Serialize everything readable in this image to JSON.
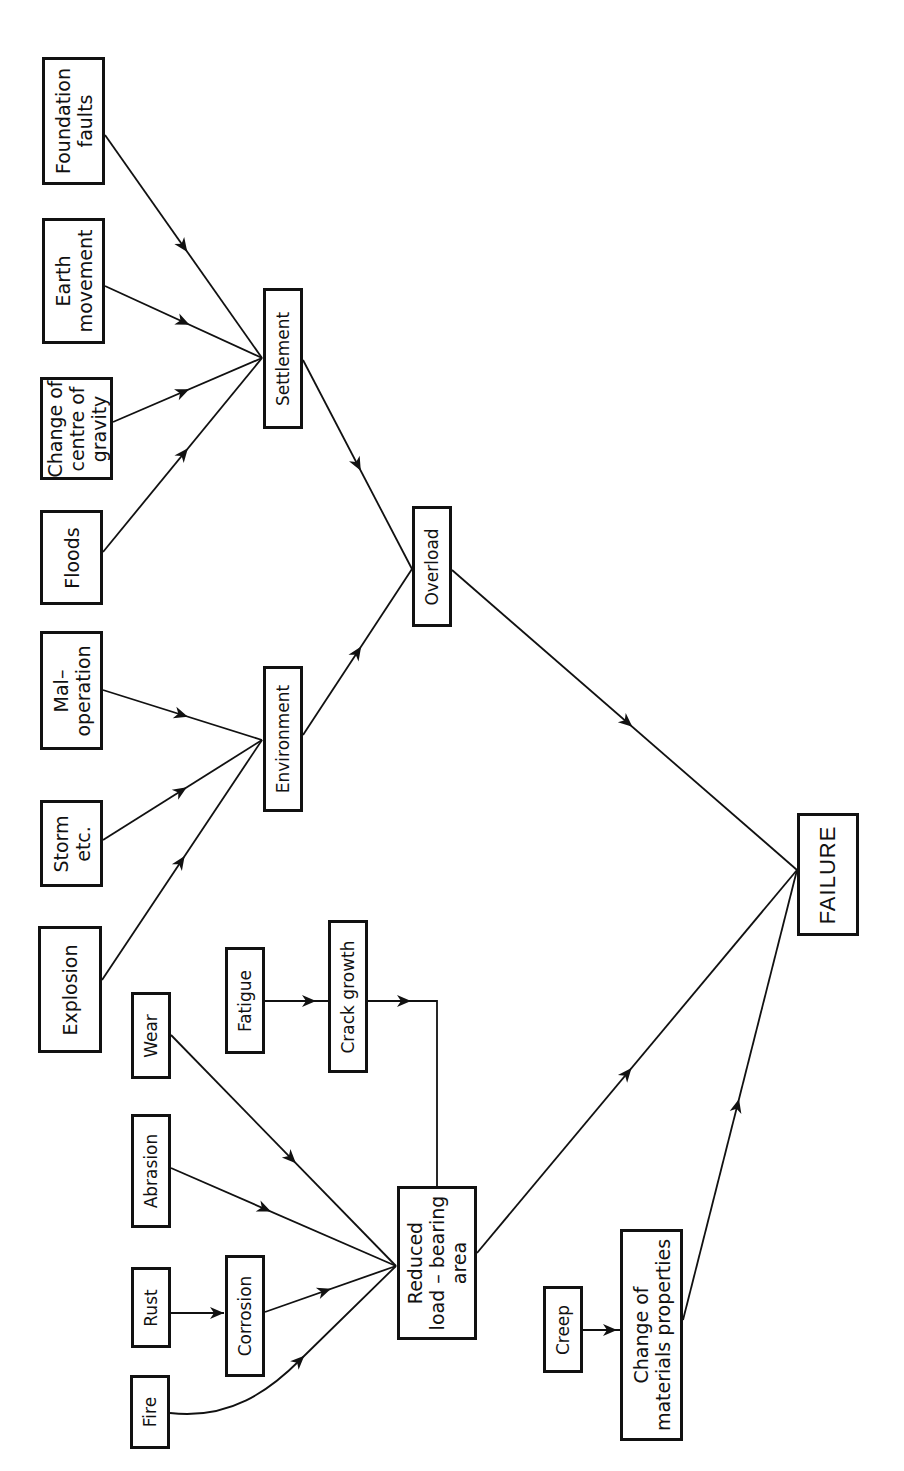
{
  "diagram": {
    "type": "fault-tree / cause-effect flow diagram",
    "orientation": "rotated 90 degrees counter-clockwise; text reads bottom-to-top",
    "line_color": "#111111",
    "background": "#ffffff",
    "nodes": [
      {
        "id": "foundation_faults",
        "label": "Foundation\nfaults",
        "x": 42,
        "y": 57,
        "w": 63,
        "h": 128
      },
      {
        "id": "earth_movement",
        "label": "Earth\nmovement",
        "x": 42,
        "y": 218,
        "w": 63,
        "h": 126
      },
      {
        "id": "change_centre_gravity",
        "label": "Change of\ncentre of\ngravity",
        "x": 40,
        "y": 377,
        "w": 73,
        "h": 103
      },
      {
        "id": "floods",
        "label": "Floods",
        "x": 40,
        "y": 510,
        "w": 63,
        "h": 95
      },
      {
        "id": "mal_operation",
        "label": "Mal–\noperation",
        "x": 40,
        "y": 631,
        "w": 63,
        "h": 119
      },
      {
        "id": "storm",
        "label": "Storm\netc.",
        "x": 40,
        "y": 800,
        "w": 63,
        "h": 87
      },
      {
        "id": "explosion",
        "label": "Explosion",
        "x": 38,
        "y": 926,
        "w": 64,
        "h": 127
      },
      {
        "id": "wear",
        "label": "Wear",
        "x": 131,
        "y": 992,
        "w": 40,
        "h": 87
      },
      {
        "id": "abrasion",
        "label": "Abrasion",
        "x": 131,
        "y": 1114,
        "w": 40,
        "h": 114
      },
      {
        "id": "rust",
        "label": "Rust",
        "x": 131,
        "y": 1267,
        "w": 40,
        "h": 81
      },
      {
        "id": "fire",
        "label": "Fire",
        "x": 130,
        "y": 1375,
        "w": 40,
        "h": 74
      },
      {
        "id": "fatigue",
        "label": "Fatigue",
        "x": 225,
        "y": 947,
        "w": 40,
        "h": 107
      },
      {
        "id": "crack_growth",
        "label": "Crack growth",
        "x": 328,
        "y": 920,
        "w": 40,
        "h": 153
      },
      {
        "id": "corrosion",
        "label": "Corrosion",
        "x": 225,
        "y": 1255,
        "w": 40,
        "h": 122
      },
      {
        "id": "settlement",
        "label": "Settlement",
        "x": 263,
        "y": 288,
        "w": 40,
        "h": 141
      },
      {
        "id": "environment",
        "label": "Environment",
        "x": 263,
        "y": 666,
        "w": 40,
        "h": 146
      },
      {
        "id": "overload",
        "label": "Overload",
        "x": 412,
        "y": 506,
        "w": 40,
        "h": 121
      },
      {
        "id": "reduced_load_bearing_area",
        "label": "Reduced\nload – bearing\narea",
        "x": 397,
        "y": 1186,
        "w": 80,
        "h": 154
      },
      {
        "id": "creep",
        "label": "Creep",
        "x": 543,
        "y": 1286,
        "w": 40,
        "h": 87
      },
      {
        "id": "change_materials_properties",
        "label": "Change of\nmaterials properties",
        "x": 620,
        "y": 1229,
        "w": 63,
        "h": 212
      },
      {
        "id": "failure",
        "label": "FAILURE",
        "x": 797,
        "y": 813,
        "w": 62,
        "h": 123
      }
    ],
    "edges": [
      {
        "from": "foundation_faults",
        "to": "settlement",
        "d": "M105,135 L262,358",
        "arrow": [
          184,
          247
        ]
      },
      {
        "from": "earth_movement",
        "to": "settlement",
        "d": "M105,286 L262,358",
        "arrow": [
          184,
          322
        ]
      },
      {
        "from": "change_centre_gravity",
        "to": "settlement",
        "d": "M113,422 L262,358",
        "arrow": [
          184,
          391
        ]
      },
      {
        "from": "floods",
        "to": "settlement",
        "d": "M103,552 L262,358",
        "arrow": [
          184,
          453
        ]
      },
      {
        "from": "mal_operation",
        "to": "environment",
        "d": "M103,690 L262,740",
        "arrow": [
          182,
          714
        ]
      },
      {
        "from": "storm",
        "to": "environment",
        "d": "M103,840 L262,740",
        "arrow": [
          182,
          791
        ]
      },
      {
        "from": "explosion",
        "to": "environment",
        "d": "M102,980 L262,740",
        "arrow": [
          182,
          861
        ]
      },
      {
        "from": "settlement",
        "to": "overload",
        "d": "M303,360 L412,569",
        "arrow": [
          358,
          465
        ]
      },
      {
        "from": "environment",
        "to": "overload",
        "d": "M303,735 L412,569",
        "arrow": [
          357,
          651
        ]
      },
      {
        "from": "overload",
        "to": "failure",
        "d": "M452,570 L797,870",
        "arrow": [
          628,
          723
        ]
      },
      {
        "from": "fatigue",
        "to": "crack_growth",
        "d": "M265,1001 L328,1001",
        "arrow": [
          310,
          1001
        ]
      },
      {
        "from": "crack_growth",
        "to": "reduced_load_bearing_area",
        "d": "M368,1001 L437,1001 L437,1186",
        "arrow": [
          405,
          1001
        ]
      },
      {
        "from": "wear",
        "to": "reduced_load_bearing_area",
        "d": "M171,1035 L396,1266",
        "arrow": [
          291,
          1159
        ]
      },
      {
        "from": "abrasion",
        "to": "reduced_load_bearing_area",
        "d": "M171,1168 L396,1266",
        "arrow": [
          266,
          1209
        ]
      },
      {
        "from": "rust",
        "to": "corrosion",
        "d": "M171,1313 L224,1313",
        "arrow": [
          218,
          1313
        ]
      },
      {
        "from": "corrosion",
        "to": "reduced_load_bearing_area",
        "d": "M265,1312 L396,1266",
        "arrow": [
          325,
          1291
        ]
      },
      {
        "from": "fire",
        "to": "reduced_load_bearing_area",
        "d": "M170,1413 C230,1420 270,1390 300,1360 L396,1266",
        "arrow": [
          300,
          1360
        ]
      },
      {
        "from": "reduced_load_bearing_area",
        "to": "failure",
        "d": "M477,1253 L797,870",
        "arrow": [
          628,
          1073
        ]
      },
      {
        "from": "creep",
        "to": "change_materials_properties",
        "d": "M583,1330 L620,1330",
        "arrow": [
          611,
          1330
        ]
      },
      {
        "from": "change_materials_properties",
        "to": "failure",
        "d": "M683,1320 L797,870",
        "arrow": [
          738,
          1105
        ]
      }
    ]
  }
}
